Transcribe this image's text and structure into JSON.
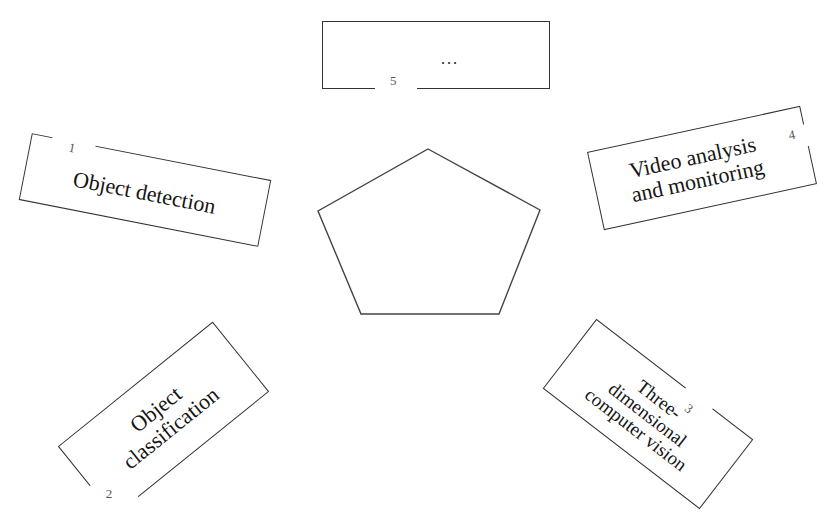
{
  "diagram": {
    "type": "radial-topic-map",
    "center_shape": "pentagon",
    "center_pentagon_points": [
      [
        428,
        149
      ],
      [
        540,
        210
      ],
      [
        499,
        314
      ],
      [
        361,
        314
      ],
      [
        318,
        211
      ]
    ],
    "stroke_color": "#333333",
    "background": "#ffffff",
    "nodes": [
      {
        "id": 1,
        "number": "1",
        "label": "Object detection",
        "position": "upper-left"
      },
      {
        "id": 2,
        "number": "2",
        "label": "Object\nclassification",
        "position": "lower-left"
      },
      {
        "id": 3,
        "number": "3",
        "label": "Three-\ndimensional\ncomputer vision",
        "position": "lower-right"
      },
      {
        "id": 4,
        "number": "4",
        "label": "Video analysis\nand monitoring",
        "position": "upper-right"
      },
      {
        "id": 5,
        "number": "5",
        "label": "...",
        "position": "top"
      }
    ]
  }
}
